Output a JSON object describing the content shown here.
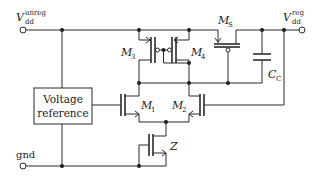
{
  "diagram": {
    "type": "circuit-schematic",
    "terminals": {
      "vin": {
        "main": "V",
        "sub": "dd",
        "sup": "unreg"
      },
      "vout": {
        "main": "V",
        "sub": "dd",
        "sup": "reg"
      },
      "gnd": {
        "label": "gnd"
      }
    },
    "blocks": {
      "vref": {
        "line1": "Voltage",
        "line2": "reference"
      }
    },
    "transistors": {
      "m1": {
        "main": "M",
        "sub": "1"
      },
      "m2": {
        "main": "M",
        "sub": "2"
      },
      "m3": {
        "main": "M",
        "sub": "3"
      },
      "m4": {
        "main": "M",
        "sub": "4"
      },
      "ms": {
        "main": "M",
        "sub": "S"
      },
      "z": {
        "main": "Z"
      }
    },
    "capacitors": {
      "cc": {
        "main": "C",
        "sub": "C"
      }
    }
  }
}
